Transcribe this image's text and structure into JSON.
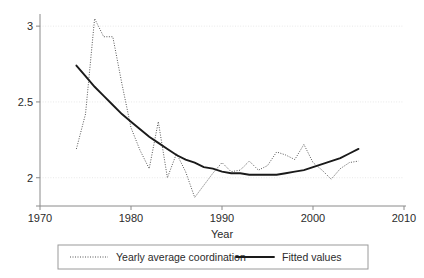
{
  "figure": {
    "background_color": "#ffffff",
    "plot_area": {
      "left": 40,
      "top": 14,
      "right": 404,
      "bottom": 202
    }
  },
  "axis": {
    "x_title": "Year",
    "x_ticks": [
      "1970",
      "1980",
      "1990",
      "2000",
      "2010"
    ],
    "y_ticks": [
      "3",
      "2.5",
      "2"
    ]
  },
  "legend": {
    "entries": [
      {
        "label": "Yearly average coordination",
        "style": "dotted",
        "color": "#555555"
      },
      {
        "label": "Fitted values",
        "style": "solid",
        "color": "#1a1a1a"
      }
    ]
  },
  "chart_data": {
    "type": "line",
    "title": "",
    "subtitle": "",
    "xlabel": "Year",
    "ylabel": "",
    "xlim": [
      1970,
      2010
    ],
    "ylim": [
      1.84,
      3.08
    ],
    "grid": true,
    "legend_position": "bottom",
    "x_ticks": [
      1970,
      1980,
      1990,
      2000,
      2010
    ],
    "y_ticks": [
      2,
      2.5,
      3
    ],
    "x": [
      1974,
      1975,
      1976,
      1977,
      1978,
      1979,
      1980,
      1981,
      1982,
      1983,
      1984,
      1985,
      1986,
      1987,
      1988,
      1989,
      1990,
      1991,
      1992,
      1993,
      1994,
      1995,
      1996,
      1997,
      1998,
      1999,
      2000,
      2001,
      2002,
      2003,
      2004,
      2005
    ],
    "series": [
      {
        "name": "Yearly average coordination",
        "style": "dotted",
        "color": "#555555",
        "values": [
          2.19,
          2.42,
          3.05,
          2.93,
          2.93,
          2.62,
          2.33,
          2.18,
          2.06,
          2.37,
          2.0,
          2.16,
          2.04,
          1.87,
          1.95,
          2.03,
          2.1,
          2.04,
          2.05,
          2.11,
          2.05,
          2.08,
          2.17,
          2.15,
          2.12,
          2.22,
          2.1,
          2.05,
          1.99,
          2.06,
          2.1,
          2.11
        ]
      },
      {
        "name": "Fitted values",
        "style": "solid",
        "color": "#1a1a1a",
        "values": [
          2.74,
          2.67,
          2.6,
          2.54,
          2.48,
          2.42,
          2.37,
          2.32,
          2.27,
          2.23,
          2.19,
          2.15,
          2.12,
          2.1,
          2.07,
          2.06,
          2.04,
          2.03,
          2.03,
          2.02,
          2.02,
          2.02,
          2.02,
          2.03,
          2.04,
          2.05,
          2.07,
          2.09,
          2.11,
          2.13,
          2.16,
          2.19
        ]
      }
    ]
  }
}
